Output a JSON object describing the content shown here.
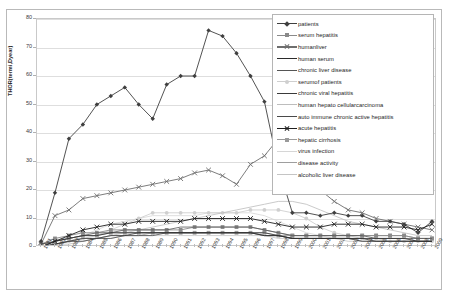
{
  "top_note": "",
  "axes": {
    "y_title": "THOR(termi,Dyear)",
    "y_ticks": [
      0,
      10,
      20,
      30,
      40,
      50,
      60,
      70,
      80
    ],
    "y_min": 0,
    "y_max": 80
  },
  "chart_data": {
    "type": "line",
    "title": "",
    "xlabel": "",
    "ylabel": "THOR(termi,Dyear)",
    "ylim": [
      0,
      80
    ],
    "grid": true,
    "legend_position": "right",
    "categories": [
      "1981",
      "1982",
      "1983",
      "1984",
      "1985",
      "1986",
      "1987",
      "1988",
      "1989",
      "1990",
      "1991",
      "1992",
      "1993",
      "1994",
      "1995",
      "1996",
      "1997",
      "1998",
      "1999",
      "2000",
      "2001",
      "2002",
      "2003",
      "2004",
      "2005",
      "2006",
      "2007",
      "2008",
      "2009"
    ],
    "series": [
      {
        "name": "patients",
        "color": "#3f3f3f",
        "marker": "diamond",
        "values": [
          2,
          19,
          38,
          43,
          50,
          53,
          56,
          50,
          45,
          57,
          60,
          60,
          76,
          74,
          68,
          60,
          51,
          28,
          12,
          12,
          11,
          12,
          11,
          11,
          9,
          9,
          8,
          5,
          9
        ]
      },
      {
        "name": "serum hepatitis",
        "color": "#8a8a8a",
        "marker": "square",
        "values": [
          1,
          3,
          4,
          5,
          5,
          6,
          6,
          6,
          6,
          6,
          6,
          7,
          7,
          7,
          7,
          7,
          6,
          5,
          4,
          4,
          4,
          4,
          4,
          4,
          4,
          4,
          4,
          3,
          3
        ]
      },
      {
        "name": "humanliver",
        "color": "#6e6e6e",
        "marker": "star",
        "values": [
          1,
          11,
          13,
          17,
          18,
          19,
          20,
          21,
          22,
          23,
          24,
          26,
          27,
          25,
          22,
          29,
          32,
          38,
          31,
          24,
          20,
          16,
          13,
          12,
          10,
          9,
          8,
          7,
          6
        ]
      },
      {
        "name": "human serum",
        "color": "#2b2b2b",
        "marker": "none",
        "values": [
          1,
          2,
          3,
          4,
          4,
          5,
          5,
          5,
          5,
          5,
          5,
          5,
          5,
          5,
          5,
          5,
          4,
          4,
          3,
          3,
          3,
          3,
          3,
          3,
          3,
          3,
          3,
          2,
          2
        ]
      },
      {
        "name": "chronic liver disease",
        "color": "#555555",
        "marker": "none",
        "values": [
          0,
          2,
          3,
          4,
          5,
          5,
          6,
          6,
          6,
          6,
          7,
          7,
          7,
          7,
          7,
          7,
          6,
          5,
          4,
          4,
          4,
          4,
          4,
          4,
          3,
          3,
          3,
          3,
          3
        ]
      },
      {
        "name": "serumof patients",
        "color": "#cfcfcf",
        "marker": "circle",
        "values": [
          0,
          1,
          2,
          3,
          4,
          6,
          8,
          10,
          12,
          12,
          12,
          12,
          12,
          12,
          12,
          13,
          13,
          13,
          12,
          10,
          7,
          5,
          4,
          3,
          3,
          2,
          2,
          2,
          2
        ]
      },
      {
        "name": "chronic viral hepatitis",
        "color": "#3a3a3a",
        "marker": "none",
        "values": [
          0,
          1,
          2,
          3,
          3,
          4,
          4,
          5,
          5,
          5,
          5,
          5,
          5,
          5,
          5,
          5,
          5,
          4,
          3,
          3,
          3,
          3,
          3,
          3,
          2,
          2,
          2,
          2,
          2
        ]
      },
      {
        "name": "human hepato cellularcarcinoma",
        "color": "#bdbdbd",
        "marker": "none",
        "values": [
          0,
          1,
          1,
          2,
          3,
          4,
          5,
          6,
          7,
          8,
          9,
          10,
          11,
          12,
          13,
          14,
          15,
          16,
          16,
          15,
          13,
          11,
          9,
          8,
          7,
          6,
          5,
          4,
          4
        ]
      },
      {
        "name": "auto immune chronic active hepatitis",
        "color": "#4a4a4a",
        "marker": "none",
        "values": [
          0,
          1,
          2,
          2,
          3,
          3,
          4,
          4,
          4,
          5,
          5,
          5,
          5,
          5,
          5,
          5,
          4,
          4,
          3,
          3,
          3,
          3,
          3,
          2,
          2,
          2,
          2,
          2,
          2
        ]
      },
      {
        "name": "acute hepatitis",
        "color": "#1f1f1f",
        "marker": "star",
        "values": [
          0,
          2,
          4,
          6,
          7,
          8,
          8,
          9,
          9,
          9,
          9,
          10,
          10,
          10,
          10,
          10,
          9,
          8,
          7,
          7,
          7,
          8,
          8,
          8,
          7,
          7,
          7,
          6,
          8
        ]
      },
      {
        "name": "hepatic cirrhosis",
        "color": "#9a9a9a",
        "marker": "square",
        "values": [
          0,
          2,
          3,
          4,
          4,
          5,
          5,
          5,
          5,
          5,
          5,
          5,
          5,
          5,
          5,
          5,
          5,
          4,
          4,
          4,
          4,
          4,
          4,
          4,
          4,
          4,
          4,
          3,
          3
        ]
      },
      {
        "name": "virus infection",
        "color": "#d6d6d6",
        "marker": "none",
        "values": [
          0,
          1,
          2,
          4,
          6,
          8,
          9,
          10,
          11,
          11,
          11,
          11,
          12,
          12,
          12,
          12,
          11,
          9,
          7,
          5,
          4,
          3,
          3,
          2,
          2,
          2,
          2,
          2,
          2
        ]
      },
      {
        "name": "disease activity",
        "color": "#9e9e9e",
        "marker": "none",
        "values": [
          0,
          1,
          2,
          3,
          3,
          4,
          4,
          4,
          5,
          5,
          5,
          5,
          5,
          5,
          5,
          5,
          4,
          4,
          3,
          3,
          3,
          3,
          3,
          2,
          2,
          2,
          2,
          2,
          2
        ]
      },
      {
        "name": "alcoholic liver disease",
        "color": "#c4c4c4",
        "marker": "none",
        "values": [
          0,
          1,
          2,
          2,
          3,
          3,
          4,
          4,
          4,
          4,
          4,
          4,
          4,
          4,
          4,
          4,
          4,
          3,
          3,
          3,
          3,
          3,
          2,
          2,
          2,
          2,
          2,
          2,
          2
        ]
      }
    ]
  },
  "legend": {
    "items": [
      {
        "label": "patients",
        "color": "#3f3f3f",
        "marker": "diamond"
      },
      {
        "label": "serum hepatitis",
        "color": "#8a8a8a",
        "marker": "square"
      },
      {
        "label": "humanliver",
        "color": "#6e6e6e",
        "marker": "star"
      },
      {
        "label": "human serum",
        "color": "#2b2b2b",
        "marker": "none"
      },
      {
        "label": "chronic liver disease",
        "color": "#555555",
        "marker": "none"
      },
      {
        "label": "serumof patients",
        "color": "#cfcfcf",
        "marker": "circle"
      },
      {
        "label": "chronic viral hepatitis",
        "color": "#3a3a3a",
        "marker": "none"
      },
      {
        "label": "human hepato cellularcarcinoma",
        "color": "#bdbdbd",
        "marker": "none"
      },
      {
        "label": "auto immune chronic active hepatitis",
        "color": "#4a4a4a",
        "marker": "none"
      },
      {
        "label": "acute hepatitis",
        "color": "#1f1f1f",
        "marker": "star"
      },
      {
        "label": "hepatic cirrhosis",
        "color": "#9a9a9a",
        "marker": "square"
      },
      {
        "label": "virus infection",
        "color": "#d6d6d6",
        "marker": "none"
      },
      {
        "label": "disease activity",
        "color": "#9e9e9e",
        "marker": "none"
      },
      {
        "label": "alcoholic liver disease",
        "color": "#c4c4c4",
        "marker": "none"
      }
    ]
  }
}
